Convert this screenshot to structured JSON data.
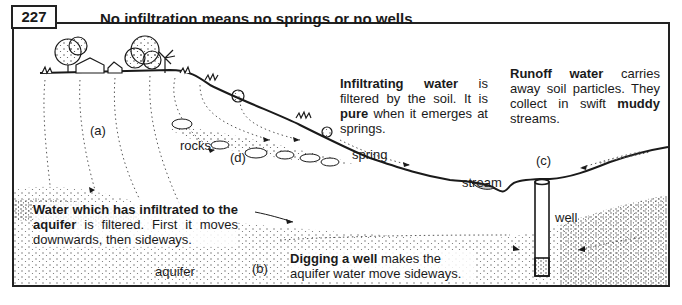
{
  "figure": {
    "number": "227",
    "title": "No infiltration means no springs or no wells"
  },
  "captions": {
    "infiltrating": {
      "bold1": "Infiltrating",
      "bold2": "water",
      "rest1": "is filtered by the soil. It is",
      "bold3": "pure",
      "rest2": "when it emerges at springs."
    },
    "runoff": {
      "bold1": "Runoff",
      "bold2": "water",
      "rest1": "carries away soil particles. They collect in swift",
      "bold3": "muddy",
      "rest2": "streams."
    },
    "aquifer_text": {
      "bold1": "Water which has infiltrated to the aquifer",
      "rest1": "is filtered. First it moves downwards, then sideways."
    },
    "well_text": {
      "bold1": "Digging a well",
      "rest1": "makes the aquifer water move sideways."
    }
  },
  "labels": {
    "a": "(a)",
    "b": "(b)",
    "c": "(c)",
    "d": "(d)",
    "rocks": "rocks",
    "spring": "spring",
    "stream": "stream",
    "well": "well",
    "aquifer": "aquifer"
  },
  "colors": {
    "ink": "#1a1a1a",
    "paper": "#ffffff"
  }
}
